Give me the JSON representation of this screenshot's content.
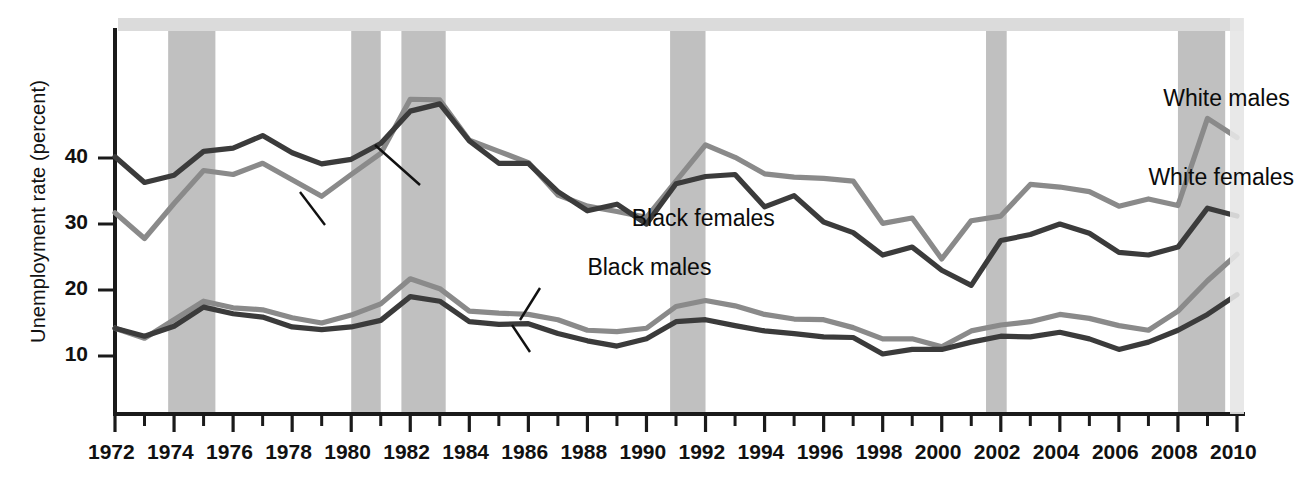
{
  "chart_data": {
    "type": "line",
    "title": "",
    "subtitle": "",
    "xlabel": "",
    "ylabel": "Unemployment rate (percent)",
    "xlim": [
      1972,
      2010
    ],
    "ylim": [
      0,
      52
    ],
    "grid": false,
    "legend_position": "inline-annotations",
    "x": [
      1972,
      1973,
      1974,
      1975,
      1976,
      1977,
      1978,
      1979,
      1980,
      1981,
      1982,
      1983,
      1984,
      1985,
      1986,
      1987,
      1988,
      1989,
      1990,
      1991,
      1992,
      1993,
      1994,
      1995,
      1996,
      1997,
      1998,
      1999,
      2000,
      2001,
      2002,
      2003,
      2004,
      2005,
      2006,
      2007,
      2008,
      2009,
      2010
    ],
    "xtick_labels": [
      "1972",
      "1974",
      "1976",
      "1978",
      "1980",
      "1982",
      "1984",
      "1986",
      "1988",
      "1990",
      "1992",
      "1994",
      "1996",
      "1998",
      "2000",
      "2002",
      "2004",
      "2006",
      "2008",
      "2010"
    ],
    "ytick_labels": [
      "10",
      "20",
      "30",
      "40"
    ],
    "yticks": [
      10,
      20,
      30,
      40
    ],
    "series": [
      {
        "name": "Black females",
        "color": "#3b3b3b",
        "values": [
          40.2,
          36.3,
          37.4,
          41.0,
          41.5,
          43.4,
          40.8,
          39.1,
          39.8,
          42.2,
          47.1,
          48.2,
          42.6,
          39.2,
          39.2,
          34.9,
          32.0,
          33.0,
          30.0,
          36.1,
          37.2,
          37.5,
          32.6,
          34.3,
          30.3,
          28.7,
          25.3,
          26.5,
          23.0,
          20.7,
          27.5,
          28.4,
          30.0,
          28.6,
          25.7,
          25.3,
          26.5,
          32.4,
          31.2
        ]
      },
      {
        "name": "Black males",
        "color": "#8a8a8a",
        "values": [
          31.7,
          27.8,
          33.1,
          38.1,
          37.5,
          39.2,
          36.7,
          34.2,
          37.5,
          40.7,
          48.9,
          48.8,
          42.7,
          41.0,
          39.3,
          34.4,
          32.7,
          31.9,
          31.0,
          36.5,
          42.0,
          40.1,
          37.6,
          37.1,
          36.9,
          36.5,
          30.1,
          30.9,
          24.7,
          30.5,
          31.2,
          36.0,
          35.6,
          34.9,
          32.7,
          33.8,
          32.8,
          46.0,
          43.1
        ]
      },
      {
        "name": "White males",
        "color": "#8a8a8a",
        "values": [
          14.2,
          12.7,
          15.5,
          18.3,
          17.3,
          17.0,
          15.8,
          15.0,
          16.2,
          17.9,
          21.7,
          20.2,
          16.8,
          16.5,
          16.3,
          15.5,
          13.9,
          13.7,
          14.2,
          17.5,
          18.4,
          17.6,
          16.3,
          15.6,
          15.5,
          14.3,
          12.6,
          12.6,
          11.4,
          13.8,
          14.7,
          15.2,
          16.3,
          15.7,
          14.6,
          13.9,
          16.8,
          21.4,
          25.4
        ]
      },
      {
        "name": "White females",
        "color": "#3b3b3b",
        "values": [
          14.2,
          13.0,
          14.5,
          17.4,
          16.4,
          15.9,
          14.4,
          14.0,
          14.4,
          15.4,
          19.0,
          18.3,
          15.2,
          14.8,
          14.9,
          13.4,
          12.3,
          11.5,
          12.6,
          15.2,
          15.5,
          14.6,
          13.8,
          13.4,
          12.9,
          12.8,
          10.3,
          11.0,
          11.0,
          12.1,
          13.0,
          12.9,
          13.6,
          12.6,
          11.0,
          12.1,
          13.9,
          16.3,
          19.3
        ]
      }
    ],
    "annotations": [
      {
        "text": "Black females",
        "series": "Black females",
        "x": 17.5,
        "y": 30.8
      },
      {
        "text": "Black males",
        "series": "Black males",
        "x": 16.0,
        "y": 23.4
      },
      {
        "text": "White males",
        "series": "White males",
        "x": 35.5,
        "y": 49.0
      },
      {
        "text": "White females",
        "series": "White females",
        "x": 35.0,
        "y": 37.0
      }
    ],
    "shaded_bands": {
      "label": "recession",
      "color": "#c0c0c0",
      "ranges": [
        [
          1973.8,
          1975.4
        ],
        [
          1980.0,
          1981.0
        ],
        [
          1981.7,
          1983.2
        ],
        [
          1990.8,
          1992.0
        ],
        [
          2001.5,
          2002.2
        ],
        [
          2008.0,
          2009.6
        ]
      ]
    }
  },
  "axis": {
    "y_title": "Unemployment rate (percent)"
  }
}
